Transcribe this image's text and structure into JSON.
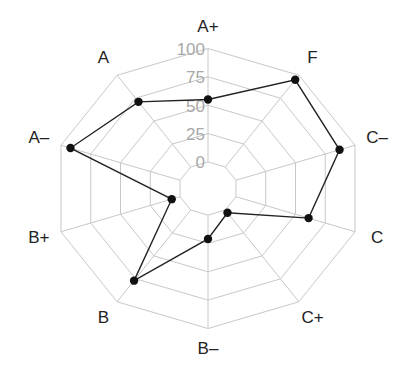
{
  "chart_data": {
    "type": "radar",
    "title": "",
    "categories": [
      "A+",
      "F",
      "C–",
      "C",
      "C+",
      "B–",
      "B",
      "B+",
      "A–",
      "A"
    ],
    "series": [
      {
        "name": "grades",
        "values": [
          55,
          95,
          87,
          61,
          3,
          21,
          77,
          7,
          92,
          71
        ]
      }
    ],
    "radial_ticks": [
      "0",
      "25",
      "50",
      "75",
      "100"
    ],
    "tick_values": [
      0,
      25,
      50,
      75,
      100
    ],
    "rlim": [
      0,
      100
    ],
    "grid": true,
    "legend": false,
    "colors": {
      "grid": "#c8c8c8",
      "line": "#222222",
      "marker": "#111111",
      "tick_text": "#a8a8a8",
      "label_text": "#222222"
    }
  }
}
